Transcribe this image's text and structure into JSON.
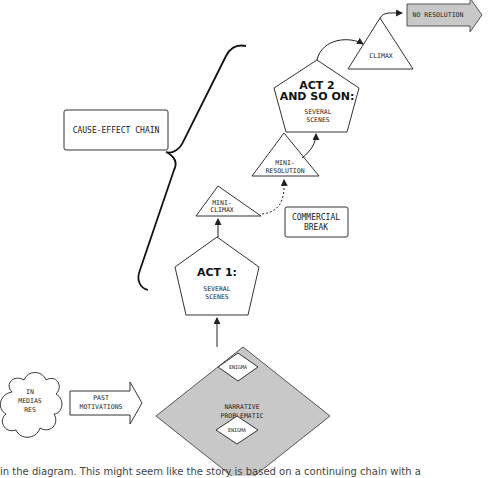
{
  "diagram": {
    "start": {
      "label_lines": [
        "IN",
        "MEDIAS",
        "RES"
      ]
    },
    "past_motivations": {
      "label_lines": [
        "PAST",
        "MOTIVATIONS"
      ]
    },
    "narrative_problematic": {
      "label_lines": [
        "NARRATIVE",
        "PROBLEMATIC"
      ],
      "fill": "#c8c8c8",
      "enigmas": [
        {
          "label": "ENIGMA"
        },
        {
          "label": "ENIGMA"
        }
      ]
    },
    "act1": {
      "title": "ACT 1:",
      "sub_lines": [
        "SEVERAL",
        "SCENES"
      ]
    },
    "mini_climax": {
      "label_lines": [
        "MINI-",
        "CLIMAX"
      ]
    },
    "commercial_break": {
      "label_lines": [
        "COMMERCIAL",
        "BREAK"
      ]
    },
    "mini_resolution": {
      "label_lines": [
        "MINI-",
        "RESOLUTION"
      ]
    },
    "act2": {
      "title_lines": [
        "ACT 2",
        "AND SO ON:"
      ],
      "sub_lines": [
        "SEVERAL",
        "SCENES"
      ]
    },
    "climax": {
      "label": "CLIMAX"
    },
    "no_resolution": {
      "label": "NO RESOLUTION",
      "fill": "#c8c8c8"
    },
    "cause_effect": {
      "label": "CAUSE-EFFECT CHAIN"
    }
  },
  "caption": "in the diagram. This might seem like the story is based on a continuing chain with a"
}
